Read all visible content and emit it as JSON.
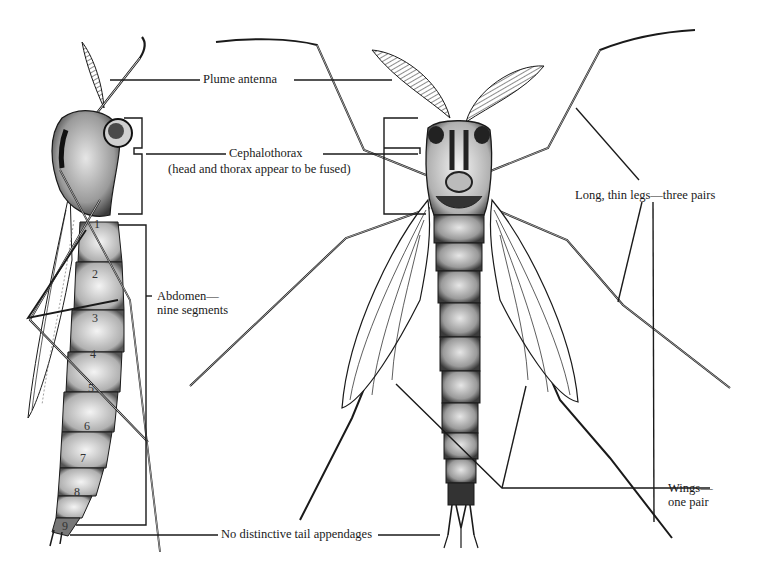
{
  "figure": {
    "views": [
      "lateral-view",
      "dorsal-view"
    ]
  },
  "labels": {
    "plume_antenna": "Plume antenna",
    "cephalothorax": "Cephalothorax",
    "cephalothorax_note": "(head and thorax appear to be fused)",
    "legs": "Long, thin legs—three pairs",
    "abdomen_line1": "Abdomen—",
    "abdomen_line2": "nine segments",
    "wings_line1": "Wings—",
    "wings_line2": "one pair",
    "tail": "No distinctive tail appendages"
  },
  "segment_numbers": [
    "1",
    "2",
    "3",
    "4",
    "5",
    "6",
    "7",
    "8",
    "9"
  ],
  "colors": {
    "ink": "#1a1a1a",
    "paper": "#ffffff",
    "stipple": "#6a6a6a"
  }
}
